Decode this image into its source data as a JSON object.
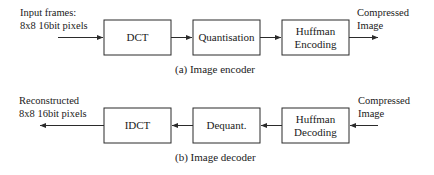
{
  "figure": {
    "type": "block-diagram",
    "stroke_color": "#2b2b2b",
    "text_color": "#1a1a1a",
    "background": "#ffffff"
  },
  "encoder": {
    "caption": "(a) Image encoder",
    "input_label_line1": "Input frames:",
    "input_label_line2": "8x8 16bit pixels",
    "output_label_line1": "Compressed",
    "output_label_line2": "Image",
    "blocks": [
      {
        "id": "dct",
        "label": "DCT",
        "label_line1": "DCT",
        "label_line2": ""
      },
      {
        "id": "quantisation",
        "label": "Quantisation",
        "label_line1": "Quantisation",
        "label_line2": ""
      },
      {
        "id": "huffman-encoding",
        "label": "Huffman Encoding",
        "label_line1": "Huffman",
        "label_line2": "Encoding"
      }
    ],
    "flow_direction": "left-to-right"
  },
  "decoder": {
    "caption": "(b) Image decoder",
    "output_label_line1": "Reconstructed",
    "output_label_line2": "8x8 16bit pixels",
    "input_label_line1": "Compressed",
    "input_label_line2": "Image",
    "blocks": [
      {
        "id": "idct",
        "label": "IDCT",
        "label_line1": "IDCT",
        "label_line2": ""
      },
      {
        "id": "dequant",
        "label": "Dequant.",
        "label_line1": "Dequant.",
        "label_line2": ""
      },
      {
        "id": "huffman-decoding",
        "label": "Huffman Decoding",
        "label_line1": "Huffman",
        "label_line2": "Decoding"
      }
    ],
    "flow_direction": "right-to-left"
  }
}
